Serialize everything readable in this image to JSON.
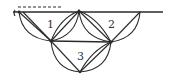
{
  "diagram": {
    "type": "triangular-arc-mesh",
    "colors": {
      "stroke": "#2a2a2a",
      "background": "#ffffff",
      "label": "#333333"
    },
    "baseline": {
      "x1": 13,
      "y1": 12,
      "x2": 163,
      "y2": 12
    },
    "dashed_line": {
      "x1": 18,
      "y1": 7,
      "x2": 62,
      "y2": 7
    },
    "vertices": {
      "A": [
        19,
        12
      ],
      "B": [
        79,
        11
      ],
      "C": [
        140,
        12
      ],
      "D": [
        51,
        41
      ],
      "E": [
        111,
        42
      ],
      "F": [
        80,
        72
      ]
    },
    "labels": [
      {
        "id": "region-1",
        "text": "1",
        "x": 47,
        "y": 28
      },
      {
        "id": "region-2",
        "text": "2",
        "x": 108,
        "y": 28
      },
      {
        "id": "region-3",
        "text": "3",
        "x": 77,
        "y": 60
      }
    ]
  }
}
